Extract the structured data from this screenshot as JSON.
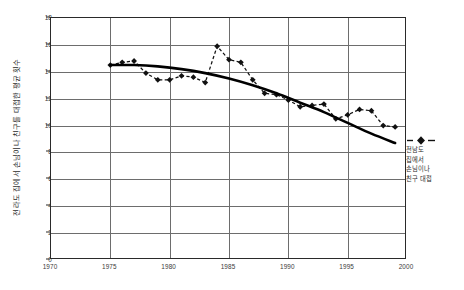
{
  "chart_data": {
    "type": "line",
    "title": "",
    "subtitle": "",
    "xlabel": "",
    "ylabel": "전라도 집에서 손님이나 친구를 대접한 평균 횟수",
    "xlim": [
      1970,
      2000
    ],
    "ylim": [
      0,
      18
    ],
    "xticks": [
      1970,
      1975,
      1980,
      1985,
      1990,
      1995,
      2000
    ],
    "yticks": [
      0,
      2,
      4,
      6,
      8,
      10,
      12,
      14,
      16,
      18
    ],
    "grid": true,
    "legend_position": "right",
    "legend_entries": [
      "전남도 집에서 손님이나 친구 대접"
    ],
    "series": [
      {
        "name": "전남도 집에서 손님이나 친구 대접",
        "style": "dashed-marker",
        "marker": "diamond",
        "color": "#111111",
        "x": [
          1975,
          1976,
          1977,
          1978,
          1979,
          1980,
          1981,
          1982,
          1983,
          1984,
          1985,
          1986,
          1987,
          1988,
          1989,
          1990,
          1991,
          1992,
          1993,
          1994,
          1995,
          1996,
          1997,
          1998,
          1999
        ],
        "values": [
          14.5,
          14.7,
          14.8,
          13.9,
          13.4,
          13.4,
          13.7,
          13.6,
          13.2,
          15.9,
          14.9,
          14.7,
          13.4,
          12.4,
          12.3,
          11.9,
          11.4,
          11.5,
          11.6,
          10.5,
          10.8,
          11.2,
          11.1,
          10.0,
          9.9
        ]
      },
      {
        "name": "추세선",
        "style": "solid-smooth",
        "marker": "none",
        "color": "#000000",
        "x": [
          1975,
          1977,
          1979,
          1981,
          1983,
          1985,
          1987,
          1989,
          1991,
          1993,
          1995,
          1997,
          1999
        ],
        "values": [
          14.5,
          14.5,
          14.4,
          14.2,
          13.9,
          13.5,
          13.0,
          12.4,
          11.7,
          11.0,
          10.2,
          9.4,
          8.7
        ]
      }
    ],
    "annotations": []
  },
  "axis": {
    "x_tick_labels": [
      "1970",
      "1975",
      "1980",
      "1985",
      "1990",
      "1995",
      "2000"
    ],
    "y_tick_labels": [
      "0",
      "2",
      "4",
      "6",
      "8",
      "10",
      "12",
      "14",
      "16",
      "18"
    ]
  },
  "legend": {
    "lines": [
      "전남도",
      "집에서",
      "손님이나",
      "친구 대접"
    ]
  },
  "ylabel_text": "전라도 집에서 손님이나 친구를 대접한 평균 횟수"
}
